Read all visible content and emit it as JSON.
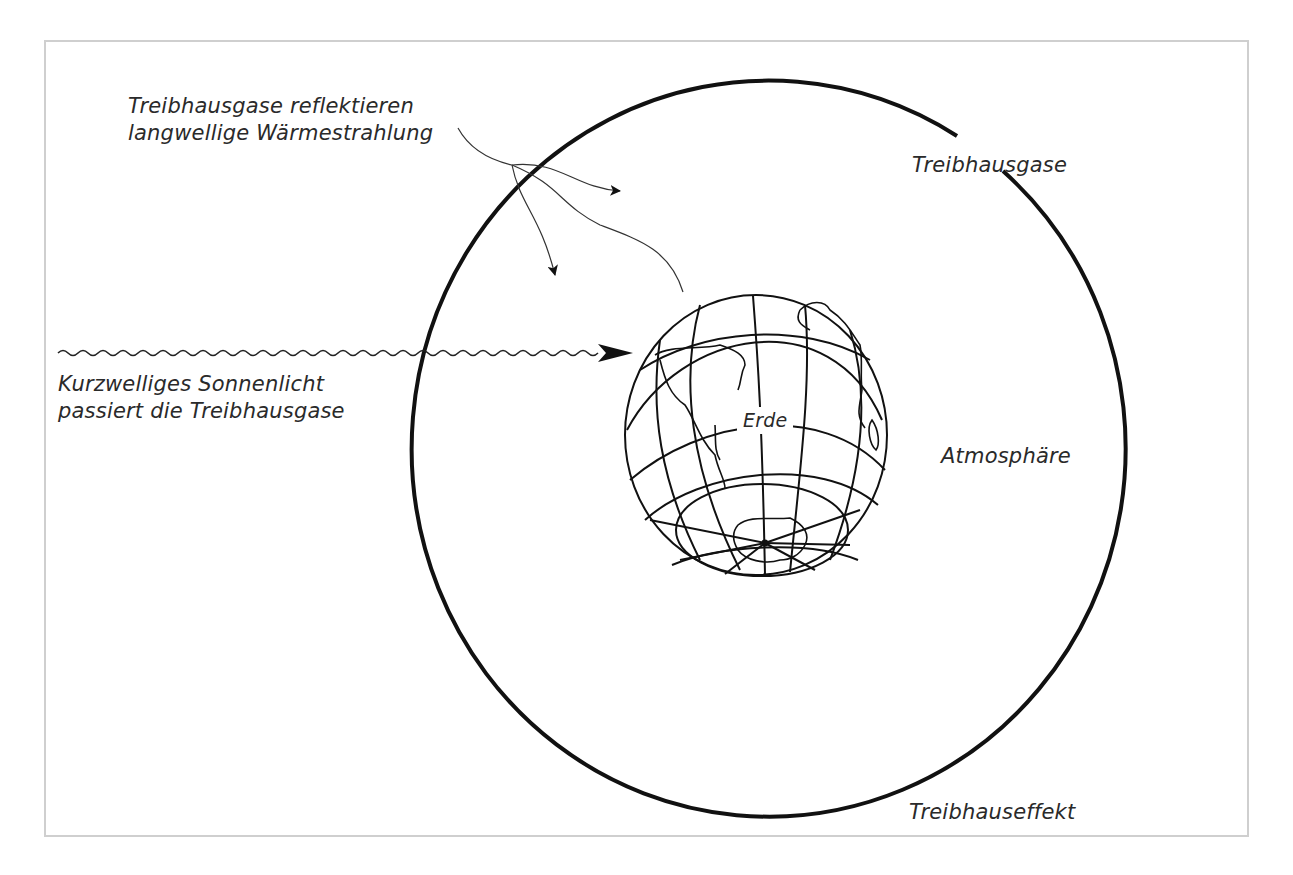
{
  "diagram": {
    "title": "Treibhauseffekt",
    "labels": {
      "reflect_line1": "Treibhausgase reflektieren",
      "reflect_line2": "langwellige Wärmestrahlung",
      "gases": "Treibhausgase",
      "sunlight_line1": "Kurzwelliges Sonnenlicht",
      "sunlight_line2": "passiert die Treibhausgase",
      "earth": "Erde",
      "atmosphere": "Atmosphäre",
      "caption": "Treibhauseffekt"
    },
    "icons": {
      "earth": "globe-icon",
      "sunlight": "wavy-arrow-icon",
      "reflection": "reflected-arrows-icon"
    },
    "colors": {
      "stroke": "#111111",
      "text": "#2a2a2a",
      "frame": "#cfcfcf",
      "background": "#ffffff"
    }
  }
}
